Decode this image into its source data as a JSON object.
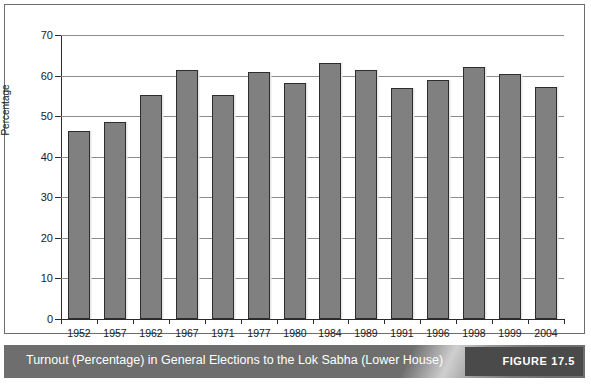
{
  "figure": {
    "caption": "Turnout (Percentage) in General Elections to the Lok Sabha (Lower House)",
    "tag": "FIGURE 17.5"
  },
  "chart_data": {
    "type": "bar",
    "title": "",
    "xlabel": "Year",
    "ylabel": "Percentage",
    "categories": [
      "1952",
      "1957",
      "1962",
      "1967",
      "1971",
      "1977",
      "1980",
      "1984",
      "1989",
      "1991",
      "1996",
      "1998",
      "1999",
      "2004"
    ],
    "values": [
      46.4,
      48.5,
      55.1,
      61.3,
      55.2,
      61.0,
      58.1,
      63.0,
      61.3,
      57.0,
      58.8,
      62.0,
      60.3,
      57.3
    ],
    "ylim": [
      0,
      70
    ],
    "yticks": [
      0,
      10,
      20,
      30,
      40,
      50,
      60,
      70
    ],
    "ytick_labels": [
      "0",
      "10",
      "20",
      "30",
      "40",
      "50",
      "60",
      "70"
    ],
    "grid": true,
    "legend": "none",
    "bar_color": "#808080",
    "bar_edge_color": "#2d2d2d",
    "gridline_color": "#8d8d8d",
    "axis_color": "#2b2b2b"
  }
}
